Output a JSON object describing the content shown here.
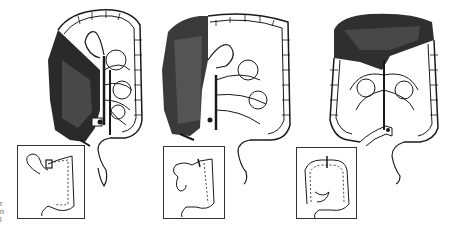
{
  "figure": {
    "colors": {
      "ink": "#1a1a1a",
      "shade_dark": "#2a2a2a",
      "shade_mid": "#5a5a5a",
      "paper": "#ffffff",
      "inset_border": "#333333"
    },
    "panels": [
      {
        "id": "right-hemicolectomy",
        "resected_region": "right colon (ascending + hepatic flexure + terminal ileum)",
        "inset": "ileo-transverse anastomosis"
      },
      {
        "id": "extended-right-hemicolectomy",
        "resected_region": "right and proximal transverse colon",
        "inset": "ileo-descending anastomosis"
      },
      {
        "id": "transverse-colectomy",
        "resected_region": "transverse colon",
        "inset": "colo-colic anastomosis"
      }
    ],
    "edge_text": [
      "r",
      "n",
      "l"
    ]
  }
}
